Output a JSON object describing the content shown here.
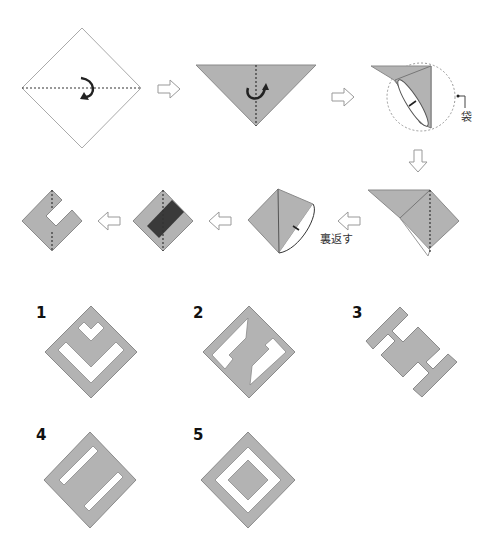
{
  "colors": {
    "paper_gray": "#b3b3b3",
    "paper_dark": "#3a3a3a",
    "edge": "#8a8a8a",
    "fold_line": "#555555",
    "arrow_outline": "#999999"
  },
  "steps": {
    "annotation_pocket": "袋",
    "annotation_turn_over": "裏返す"
  },
  "answer_options": [
    {
      "number": "1",
      "description": "diamond with heart notch and V-shaped cut"
    },
    {
      "number": "2",
      "description": "diamond with two interlocking L-shaped cuts"
    },
    {
      "number": "3",
      "description": "H-like shape with four arms"
    },
    {
      "number": "4",
      "description": "diamond with two parallel slots"
    },
    {
      "number": "5",
      "description": "diamond with square ring cut"
    }
  ]
}
